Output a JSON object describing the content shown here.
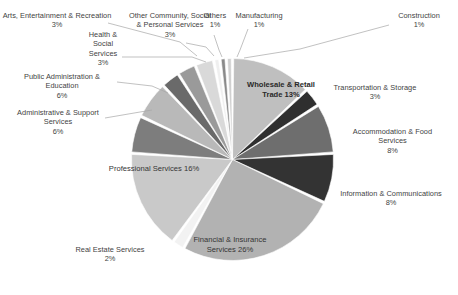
{
  "chart_data": {
    "type": "pie",
    "title": "",
    "subtitle": "",
    "xlabel": "",
    "ylabel": "",
    "legend_position": "none",
    "grid": false,
    "units": "percent",
    "start_angle_deg": 0,
    "direction": "clockwise",
    "categories": [
      "Wholesale & Retail Trade",
      "Transportation & Storage",
      "Accommodation & Food Services",
      "Information & Communications",
      "Financial & Insurance Services",
      "Real Estate Services",
      "Professional Services",
      "Administrative & Support Services",
      "Public Administration & Education",
      "Health & Social Services",
      "Arts, Entertainment & Recreation",
      "Other Community, Social & Personal Services",
      "Others",
      "Manufacturing",
      "Construction"
    ],
    "values": [
      13,
      3,
      8,
      8,
      26,
      2,
      16,
      6,
      6,
      3,
      3,
      3,
      1,
      1,
      1
    ],
    "value_labels": [
      "13%",
      "3%",
      "8%",
      "8%",
      "26%",
      "2%",
      "16%",
      "6%",
      "6%",
      "3%",
      "3%",
      "3%",
      "1%",
      "1%",
      "1%"
    ],
    "colors": [
      "#bfbfbf",
      "#2f2f2f",
      "#6e6e6e",
      "#333333",
      "#b2b2b2",
      "#f2f2f2",
      "#c9c9c9",
      "#7d7d7d",
      "#b9b9b9",
      "#6a6a6a",
      "#9a9a9a",
      "#d9d9d9",
      "#efefef",
      "#8a8a8a",
      "#d0d0d0"
    ],
    "slice_gap_color": "#ffffff"
  },
  "labels": {
    "wholesale": {
      "name": "Wholesale & Retail Trade",
      "line1": "Wholesale & Retail",
      "line2": "Trade",
      "pct": "13%"
    },
    "transport": {
      "name": "Transportation & Storage",
      "line1": "Transportation &",
      "line2": "Storage",
      "pct": "3%"
    },
    "accommodation": {
      "name": "Accommodation & Food Services",
      "line1": "Accommodation &",
      "line2": "Food Services",
      "pct": "8%"
    },
    "information": {
      "name": "Information & Communications",
      "line1": "Information &",
      "line2": "Communications",
      "pct": "8%"
    },
    "financial": {
      "name": "Financial & Insurance Services",
      "line1": "Financial & Insurance",
      "line2": "Services",
      "pct": "26%"
    },
    "realestate": {
      "name": "Real Estate Services",
      "line1": "Real Estate Services",
      "line2": "",
      "pct": "2%"
    },
    "professional": {
      "name": "Professional Services",
      "line1": "Professional Services",
      "line2": "",
      "pct": "16%"
    },
    "administrative": {
      "name": "Administrative & Support Services",
      "line1": "Administrative &",
      "line2": "Support Services",
      "pct": "6%"
    },
    "publicadmin": {
      "name": "Public Administration & Education",
      "line1": "Public Administration",
      "line2": "& Education",
      "pct": "6%"
    },
    "health": {
      "name": "Health & Social Services",
      "line1": "Health &",
      "line2": "Social",
      "line3": "Services",
      "pct": "3%"
    },
    "arts": {
      "name": "Arts, Entertainment & Recreation",
      "line1": "Arts, Entertainment &",
      "line2": "Recreation",
      "pct": "3%"
    },
    "othercommunity": {
      "name": "Other Community, Social & Personal Services",
      "line1": "Other Community,",
      "line2": "Social & Personal",
      "line3": "Services",
      "pct": "3%"
    },
    "others": {
      "name": "Others",
      "line1": "Others",
      "line2": "",
      "pct": "1%"
    },
    "manufacturing": {
      "name": "Manufacturing",
      "line1": "Manufacturing",
      "line2": "",
      "pct": "1%"
    },
    "construction": {
      "name": "Construction",
      "line1": "Construction",
      "line2": "",
      "pct": "1%"
    }
  }
}
